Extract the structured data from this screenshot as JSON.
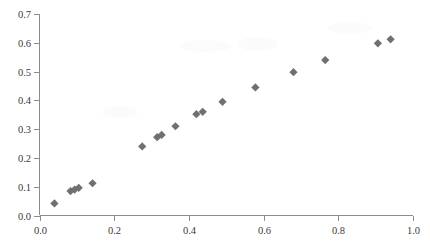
{
  "chart_data": {
    "type": "scatter",
    "title": "",
    "subtitle": "",
    "xlabel": "",
    "ylabel": "",
    "xlim": [
      0.0,
      1.0
    ],
    "ylim": [
      0.0,
      0.7
    ],
    "grid": false,
    "legend": null,
    "legend_position": "none",
    "marker_shape": "diamond",
    "marker_color": "#707070",
    "marker_size": 7,
    "xticks": [
      0.0,
      0.2,
      0.4,
      0.6,
      0.8,
      1.0
    ],
    "xticklabels": [
      "0.0",
      "0.2",
      "0.4",
      "0.6",
      "0.8",
      "1.0"
    ],
    "yticks": [
      0.0,
      0.1,
      0.2,
      0.3,
      0.4,
      0.5,
      0.6,
      0.7
    ],
    "yticklabels": [
      "0.0",
      "0.1",
      "0.2",
      "0.3",
      "0.4",
      "0.5",
      "0.6",
      "0.7"
    ],
    "series": [
      {
        "name": "series-1",
        "color": "#707070",
        "points": [
          {
            "x": 0.04,
            "y": 0.042
          },
          {
            "x": 0.083,
            "y": 0.085
          },
          {
            "x": 0.094,
            "y": 0.09
          },
          {
            "x": 0.105,
            "y": 0.096
          },
          {
            "x": 0.142,
            "y": 0.112
          },
          {
            "x": 0.275,
            "y": 0.24
          },
          {
            "x": 0.315,
            "y": 0.272
          },
          {
            "x": 0.327,
            "y": 0.28
          },
          {
            "x": 0.364,
            "y": 0.31
          },
          {
            "x": 0.42,
            "y": 0.352
          },
          {
            "x": 0.437,
            "y": 0.36
          },
          {
            "x": 0.49,
            "y": 0.395
          },
          {
            "x": 0.578,
            "y": 0.445
          },
          {
            "x": 0.68,
            "y": 0.498
          },
          {
            "x": 0.765,
            "y": 0.54
          },
          {
            "x": 0.906,
            "y": 0.598
          },
          {
            "x": 0.94,
            "y": 0.612
          }
        ]
      }
    ]
  },
  "axis": {
    "x_axis_name": "x-axis",
    "y_axis_name": "y-axis"
  }
}
